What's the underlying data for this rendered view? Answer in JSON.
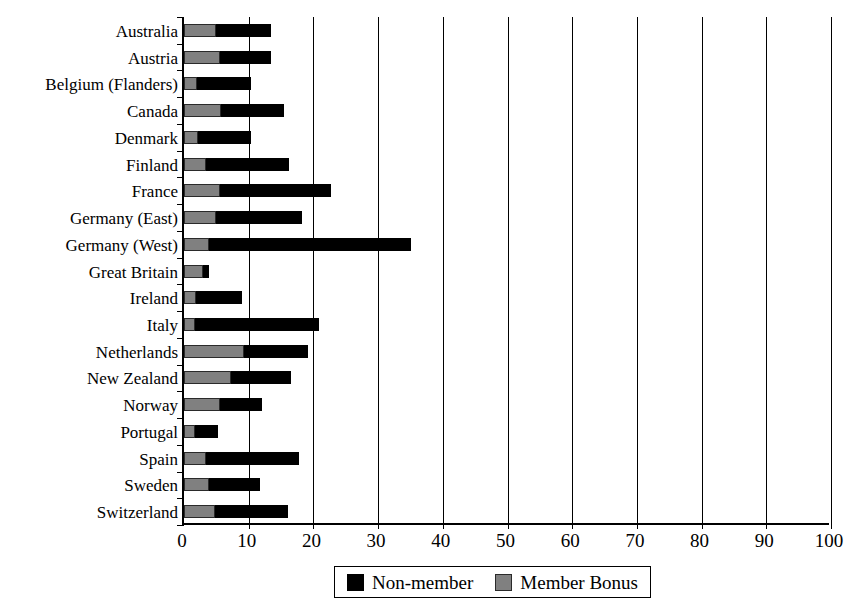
{
  "chart_data": {
    "type": "bar",
    "orientation": "horizontal",
    "stacked": true,
    "title": "",
    "xlabel": "",
    "ylabel": "",
    "xlim": [
      0,
      100
    ],
    "xticks": [
      0,
      10,
      20,
      30,
      40,
      50,
      60,
      70,
      80,
      90,
      100
    ],
    "xtick_labels": [
      "0",
      "10",
      "20",
      "30",
      "40",
      "50",
      "60",
      "70",
      "80",
      "90",
      "100"
    ],
    "grid": "vertical",
    "legend_position": "bottom-center",
    "categories": [
      "Australia",
      "Austria",
      "Belgium (Flanders)",
      "Canada",
      "Denmark",
      "Finland",
      "France",
      "Germany (East)",
      "Germany (West)",
      "Great Britain",
      "Ireland",
      "Italy",
      "Netherlands",
      "New Zealand",
      "Norway",
      "Portugal",
      "Spain",
      "Sweden",
      "Switzerland"
    ],
    "series": [
      {
        "name": "Member Bonus",
        "color": "#808080",
        "values": [
          5.0,
          5.6,
          2.0,
          5.7,
          2.2,
          3.4,
          5.6,
          5.0,
          3.9,
          3.0,
          1.9,
          1.7,
          9.2,
          7.2,
          5.6,
          1.7,
          3.4,
          3.9,
          4.8
        ]
      },
      {
        "name": "Non-member",
        "color": "#000000",
        "values": [
          8.4,
          7.8,
          8.4,
          9.7,
          8.2,
          12.9,
          17.1,
          13.3,
          31.2,
          0.9,
          7.1,
          19.1,
          9.9,
          9.3,
          6.5,
          3.6,
          14.3,
          7.9,
          11.2
        ]
      }
    ],
    "totals": [
      13.4,
      13.4,
      10.4,
      15.4,
      10.4,
      16.3,
      22.7,
      18.3,
      35.1,
      3.9,
      9.0,
      20.8,
      19.1,
      16.5,
      12.1,
      5.3,
      17.7,
      11.8,
      16.0
    ]
  },
  "legend": {
    "entries": [
      {
        "label": "Non-member",
        "swatch": "black"
      },
      {
        "label": "Member Bonus",
        "swatch": "gray"
      }
    ]
  }
}
